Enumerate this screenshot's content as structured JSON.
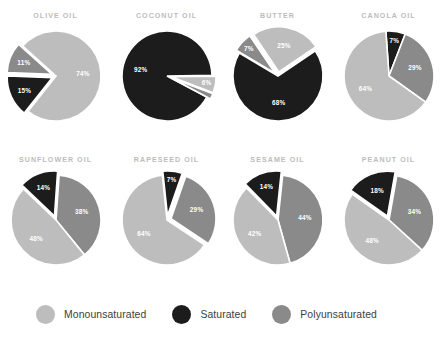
{
  "colors": {
    "monounsaturated": "#bdbdbd",
    "saturated": "#1c1c1c",
    "polyunsaturated": "#8a8a8a",
    "background": "#ffffff",
    "title": "#bcbcbc",
    "legend_text": "#3d3d3d",
    "slice_label": "#ffffff"
  },
  "legend": {
    "position": "bottom",
    "items": [
      {
        "label": "Monounsaturated",
        "key": "monounsaturated",
        "color": "#bdbdbd",
        "swatch_icon": "circle-swatch-icon"
      },
      {
        "label": "Saturated",
        "key": "saturated",
        "color": "#1c1c1c",
        "swatch_icon": "circle-swatch-icon"
      },
      {
        "label": "Polyunsaturated",
        "key": "polyunsaturated",
        "color": "#8a8a8a",
        "swatch_icon": "circle-swatch-icon"
      }
    ]
  },
  "chart_data": [
    {
      "type": "pie",
      "title": "OLIVE OIL",
      "categories": [
        "Monounsaturated",
        "Saturated",
        "Polyunsaturated"
      ],
      "values": [
        74,
        15,
        11
      ],
      "labels": [
        "74%",
        "15%",
        "11%"
      ],
      "colors": [
        "#bdbdbd",
        "#1c1c1c",
        "#8a8a8a"
      ],
      "start_angle": -48,
      "explode": [
        0,
        1,
        1
      ],
      "grid": false
    },
    {
      "type": "pie",
      "title": "COCONUT OIL",
      "categories": [
        "Saturated",
        "Monounsaturated",
        "Polyunsaturated"
      ],
      "values": [
        92,
        6,
        2
      ],
      "labels": [
        "92%",
        "6%",
        ""
      ],
      "colors": [
        "#1c1c1c",
        "#bdbdbd",
        "#8a8a8a"
      ],
      "start_angle": 118,
      "explode": [
        0,
        1,
        1
      ],
      "grid": false
    },
    {
      "type": "pie",
      "title": "BUTTER",
      "categories": [
        "Saturated",
        "Polyunsaturated",
        "Monounsaturated"
      ],
      "values": [
        68,
        7,
        25
      ],
      "labels": [
        "68%",
        "7%",
        "25%"
      ],
      "colors": [
        "#1c1c1c",
        "#8a8a8a",
        "#bdbdbd"
      ],
      "start_angle": 56,
      "explode": [
        0,
        1,
        1
      ],
      "grid": false
    },
    {
      "type": "pie",
      "title": "CANOLA OIL",
      "categories": [
        "Saturated",
        "Polyunsaturated",
        "Monounsaturated"
      ],
      "values": [
        7,
        29,
        64
      ],
      "labels": [
        "7%",
        "29%",
        "64%"
      ],
      "colors": [
        "#1c1c1c",
        "#8a8a8a",
        "#bdbdbd"
      ],
      "start_angle": -4,
      "explode": [
        0,
        0,
        0
      ],
      "grid": false
    },
    {
      "type": "pie",
      "title": "SUNFLOWER OIL",
      "categories": [
        "Polyunsaturated",
        "Monounsaturated",
        "Saturated"
      ],
      "values": [
        38,
        48,
        14
      ],
      "labels": [
        "38%",
        "48%",
        "14%"
      ],
      "colors": [
        "#8a8a8a",
        "#bdbdbd",
        "#1c1c1c"
      ],
      "start_angle": 4,
      "explode": [
        0,
        0,
        1
      ],
      "grid": false
    },
    {
      "type": "pie",
      "title": "RAPESEED OIL",
      "categories": [
        "Saturated",
        "Polyunsaturated",
        "Monounsaturated"
      ],
      "values": [
        7,
        29,
        64
      ],
      "labels": [
        "7%",
        "29%",
        "64%"
      ],
      "colors": [
        "#1c1c1c",
        "#8a8a8a",
        "#bdbdbd"
      ],
      "start_angle": -6,
      "explode": [
        1,
        1,
        0
      ],
      "grid": false
    },
    {
      "type": "pie",
      "title": "SESAME OIL",
      "categories": [
        "Polyunsaturated",
        "Monounsaturated",
        "Saturated"
      ],
      "values": [
        44,
        42,
        14
      ],
      "labels": [
        "44%",
        "42%",
        "14%"
      ],
      "colors": [
        "#8a8a8a",
        "#bdbdbd",
        "#1c1c1c"
      ],
      "start_angle": 6,
      "explode": [
        0,
        0,
        1
      ],
      "grid": false
    },
    {
      "type": "pie",
      "title": "PEANUT OIL",
      "categories": [
        "Polyunsaturated",
        "Monounsaturated",
        "Saturated"
      ],
      "values": [
        34,
        48,
        18
      ],
      "labels": [
        "34%",
        "48%",
        "18%"
      ],
      "colors": [
        "#8a8a8a",
        "#bdbdbd",
        "#1c1c1c"
      ],
      "start_angle": 10,
      "explode": [
        0,
        0,
        1
      ],
      "grid": false
    }
  ]
}
